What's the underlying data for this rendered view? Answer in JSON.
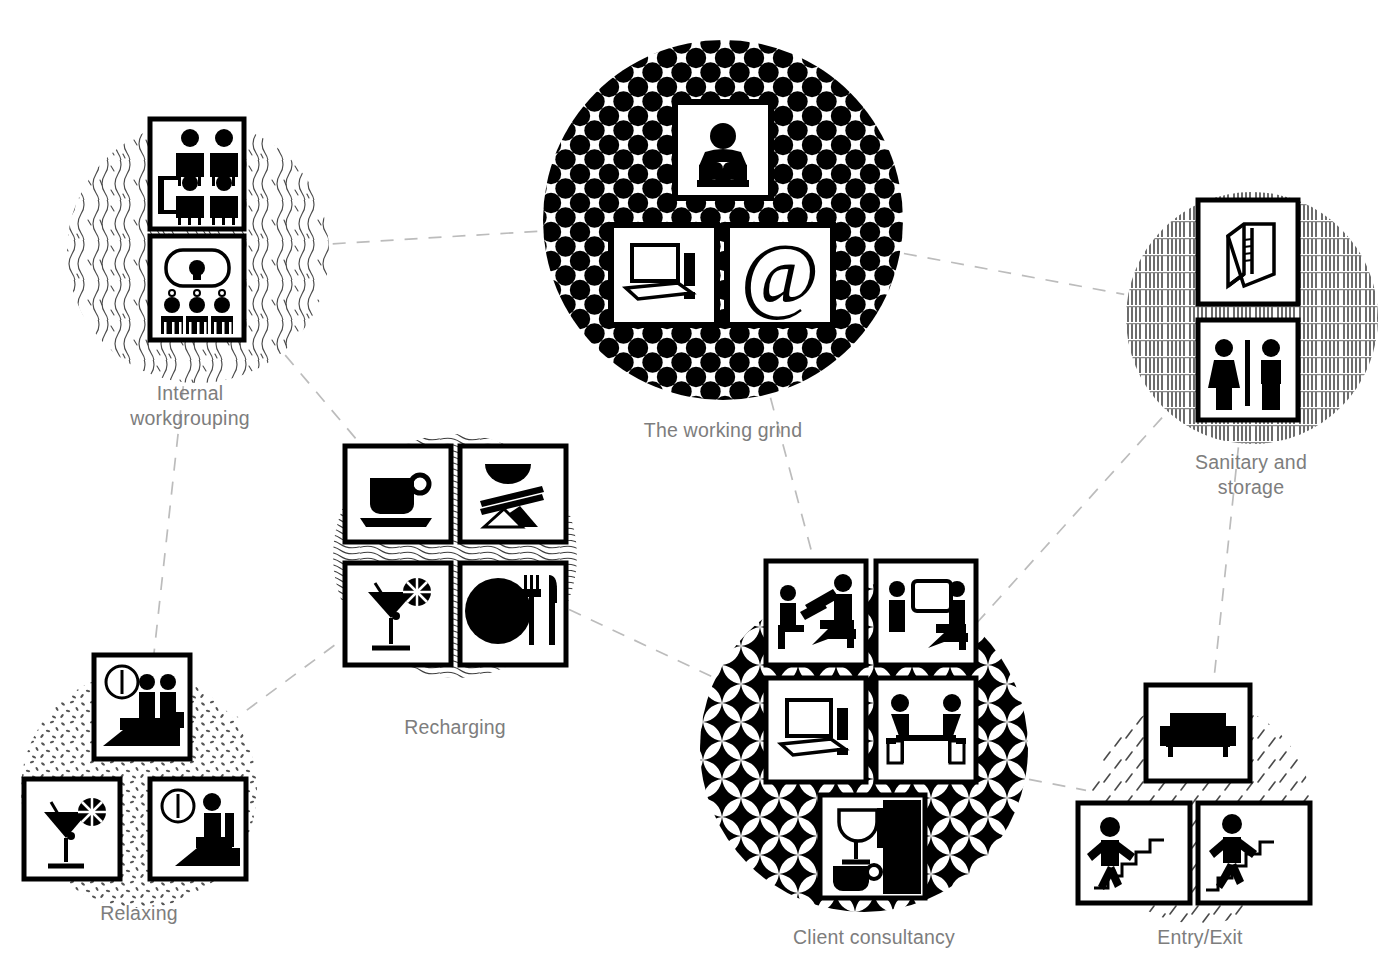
{
  "diagram": {
    "type": "node-link pictogram diagram",
    "background_color": "#ffffff",
    "label_color": "#7d7d7d",
    "link_color": "#b5b5b5",
    "link_style": "dashed"
  },
  "clusters": [
    {
      "id": "internal-workgrouping",
      "label": "Internal\nworkgrouping",
      "label_x": 190,
      "label_y": 381,
      "texture": "squiggle-wave",
      "circle": {
        "cx": 198,
        "cy": 252,
        "r": 131
      },
      "tiles": [
        {
          "name": "meeting-people-icon",
          "x": 150,
          "y": 119,
          "w": 94,
          "h": 110
        },
        {
          "name": "presentation-audience-icon",
          "x": 150,
          "y": 236,
          "w": 94,
          "h": 104
        }
      ]
    },
    {
      "id": "the-working-grind",
      "label": "The working grind",
      "label_x": 723,
      "label_y": 418,
      "texture": "halftone-dots",
      "circle": {
        "cx": 723,
        "cy": 220,
        "r": 180
      },
      "tiles": [
        {
          "name": "person-reading-icon",
          "x": 675,
          "y": 102,
          "w": 96,
          "h": 96
        },
        {
          "name": "desktop-computer-icon",
          "x": 611,
          "y": 225,
          "w": 106,
          "h": 100
        },
        {
          "name": "at-sign-email-icon",
          "x": 727,
          "y": 225,
          "w": 106,
          "h": 100
        }
      ]
    },
    {
      "id": "sanitary-and-storage",
      "label": "Sanitary and\nstorage",
      "label_x": 1251,
      "label_y": 450,
      "texture": "vertical-hatch-bricks",
      "circle": {
        "cx": 1252,
        "cy": 318,
        "r": 126
      },
      "tiles": [
        {
          "name": "storage-cabinet-icon",
          "x": 1198,
          "y": 200,
          "w": 100,
          "h": 104
        },
        {
          "name": "restroom-wc-icon",
          "x": 1198,
          "y": 320,
          "w": 100,
          "h": 100
        }
      ]
    },
    {
      "id": "recharging",
      "label": "Recharging",
      "label_x": 455,
      "label_y": 715,
      "texture": "contour-lines",
      "circle": {
        "cx": 455,
        "cy": 556,
        "r": 122
      },
      "tiles": [
        {
          "name": "coffee-cup-icon",
          "x": 345,
          "y": 446,
          "w": 106,
          "h": 96
        },
        {
          "name": "asian-food-bowl-icon",
          "x": 460,
          "y": 446,
          "w": 106,
          "h": 96
        },
        {
          "name": "cocktail-glass-icon",
          "x": 345,
          "y": 563,
          "w": 106,
          "h": 102
        },
        {
          "name": "plate-cutlery-icon",
          "x": 460,
          "y": 563,
          "w": 106,
          "h": 102
        }
      ]
    },
    {
      "id": "relaxing",
      "label": "Relaxing",
      "label_x": 139,
      "label_y": 901,
      "texture": "stipple-dots",
      "circle": {
        "cx": 139,
        "cy": 790,
        "r": 118
      },
      "tiles": [
        {
          "name": "lounge-two-people-icon",
          "x": 94,
          "y": 655,
          "w": 96,
          "h": 104
        },
        {
          "name": "cocktail-glass-icon",
          "x": 24,
          "y": 779,
          "w": 96,
          "h": 100
        },
        {
          "name": "lounge-person-armchair-icon",
          "x": 150,
          "y": 779,
          "w": 96,
          "h": 100
        }
      ]
    },
    {
      "id": "client-consultancy",
      "label": "Client consultancy",
      "label_x": 874,
      "label_y": 925,
      "texture": "four-point-star",
      "circle": {
        "cx": 864,
        "cy": 748,
        "r": 164
      },
      "tiles": [
        {
          "name": "consultation-presenting-icon",
          "x": 766,
          "y": 561,
          "w": 100,
          "h": 104
        },
        {
          "name": "consultation-screen-icon",
          "x": 876,
          "y": 561,
          "w": 100,
          "h": 104
        },
        {
          "name": "desktop-computer-icon",
          "x": 766,
          "y": 678,
          "w": 100,
          "h": 104
        },
        {
          "name": "meeting-table-two-people-icon",
          "x": 876,
          "y": 678,
          "w": 100,
          "h": 104
        },
        {
          "name": "refreshments-drinks-icon",
          "x": 820,
          "y": 795,
          "w": 105,
          "h": 103
        }
      ]
    },
    {
      "id": "entry-exit",
      "label": "Entry/Exit",
      "label_x": 1200,
      "label_y": 925,
      "texture": "diagonal-ticks",
      "circle": {
        "cx": 1200,
        "cy": 812,
        "r": 112
      },
      "tiles": [
        {
          "name": "sofa-reception-icon",
          "x": 1146,
          "y": 685,
          "w": 104,
          "h": 96
        },
        {
          "name": "stairs-up-icon",
          "x": 1078,
          "y": 803,
          "w": 112,
          "h": 100
        },
        {
          "name": "stairs-down-icon",
          "x": 1198,
          "y": 803,
          "w": 112,
          "h": 100
        }
      ]
    }
  ],
  "connections": [
    {
      "from": "internal-workgrouping",
      "to": "the-working-grind"
    },
    {
      "from": "internal-workgrouping",
      "to": "recharging"
    },
    {
      "from": "internal-workgrouping",
      "to": "relaxing"
    },
    {
      "from": "the-working-grind",
      "to": "sanitary-and-storage"
    },
    {
      "from": "the-working-grind",
      "to": "client-consultancy"
    },
    {
      "from": "recharging",
      "to": "client-consultancy"
    },
    {
      "from": "recharging",
      "to": "relaxing"
    },
    {
      "from": "client-consultancy",
      "to": "sanitary-and-storage"
    },
    {
      "from": "client-consultancy",
      "to": "entry-exit"
    },
    {
      "from": "entry-exit",
      "to": "sanitary-and-storage"
    }
  ]
}
